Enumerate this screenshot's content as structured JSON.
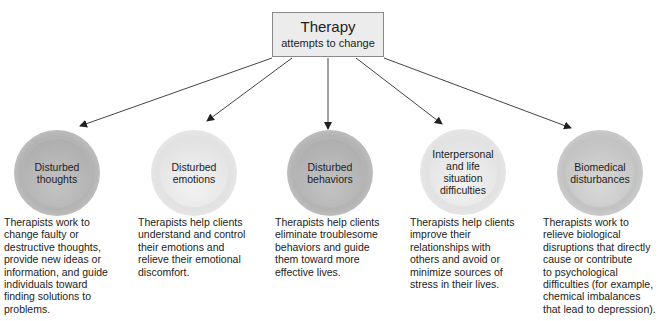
{
  "top_box": {
    "title": "Therapy",
    "subtitle": "attempts to change"
  },
  "nodes": [
    {
      "label": "Disturbed\nthoughts",
      "description": "Therapists work to\nchange faulty or\ndestructive thoughts,\nprovide new ideas or\ninformation, and guide\nindividuals toward\nfinding solutions to\nproblems."
    },
    {
      "label": "Disturbed\nemotions",
      "description": "Therapists help clients\nunderstand and control\ntheir emotions and\nrelieve their emotional\ndiscomfort."
    },
    {
      "label": "Disturbed\nbehaviors",
      "description": "Therapists help clients\neliminate troublesome\nbehaviors and guide\nthem toward more\neffective lives."
    },
    {
      "label": "Interpersonal\nand life\nsituation\ndifficulties",
      "description": "Therapists help clients\nimprove their\nrelationships with\nothers and avoid or\nminimize sources of\nstress in their lives."
    },
    {
      "label": "Biomedical\ndisturbances",
      "description": "Therapists work to\nrelieve biological\ndisruptions that directly\ncause or contribute\nto psychological\ndifficulties (for example,\nchemical imbalances\nthat lead to depression)."
    }
  ],
  "colors": {
    "box_fill": "#ececec",
    "box_border": "#8a8a8a",
    "arrow": "#333333",
    "text": "#222222"
  }
}
